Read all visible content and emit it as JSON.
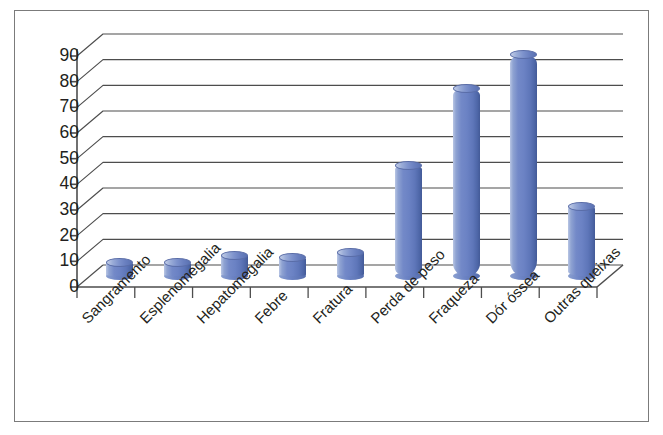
{
  "figure": {
    "title": "",
    "border_color": "#7b7b7b",
    "background": "#ffffff",
    "bar_color": "#6b82c4"
  },
  "chart_data": {
    "type": "bar",
    "style": "3d-cylinder",
    "title": "",
    "subtitle": "",
    "xlabel": "",
    "ylabel": "",
    "categories": [
      "Sangramento",
      "Esplenomegalia",
      "Hepatomegalia",
      "Febre",
      "Fratura",
      "Perda de peso",
      "Fraqueza",
      "Dór óssea",
      "Outras queixas"
    ],
    "values": [
      5,
      5,
      8,
      7,
      9,
      43,
      73,
      86,
      27
    ],
    "ylim": [
      0,
      90
    ],
    "ytick_labels": [
      "0",
      "10",
      "20",
      "30",
      "40",
      "50",
      "60",
      "70",
      "80",
      "90"
    ],
    "ytick_values": [
      0,
      10,
      20,
      30,
      40,
      50,
      60,
      70,
      80,
      90
    ],
    "grid": true,
    "grid_axis": "y",
    "legend": false,
    "legend_position": "none",
    "series": [
      {
        "name": "Queixas",
        "color": "#6b82c4",
        "values": [
          5,
          5,
          8,
          7,
          9,
          43,
          73,
          86,
          27
        ]
      }
    ]
  }
}
